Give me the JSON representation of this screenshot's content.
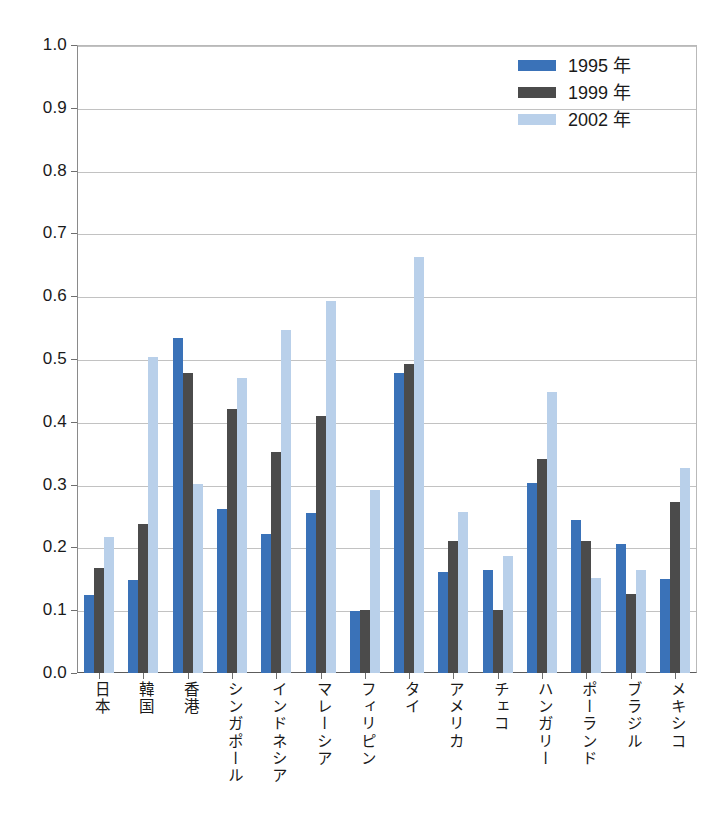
{
  "chart_data": {
    "type": "bar",
    "title": "",
    "subtitle": "",
    "xlabel": "",
    "ylabel": "",
    "ylim": [
      0.0,
      1.0
    ],
    "ytick_step": 0.1,
    "ytick_labels": [
      "0.0",
      "0.1",
      "0.2",
      "0.3",
      "0.4",
      "0.5",
      "0.6",
      "0.7",
      "0.8",
      "0.9",
      "1.0"
    ],
    "grid": "horizontal",
    "legend_position": "top-right",
    "categories": [
      "日本",
      "韓国",
      "香港",
      "シンガポール",
      "インドネシア",
      "マレーシア",
      "フィリピン",
      "タイ",
      "アメリカ",
      "チェコ",
      "ハンガリー",
      "ポーランド",
      "ブラジル",
      "メキシコ"
    ],
    "series": [
      {
        "name": "1995 年",
        "color": "#3a72b8",
        "values": [
          0.125,
          0.148,
          0.534,
          0.261,
          0.222,
          0.255,
          0.098,
          0.477,
          0.161,
          0.164,
          0.303,
          0.243,
          0.205,
          0.15
        ]
      },
      {
        "name": "1999 年",
        "color": "#4b4b4b",
        "values": [
          0.168,
          0.237,
          0.478,
          0.421,
          0.352,
          0.41,
          0.1,
          0.492,
          0.21,
          0.1,
          0.34,
          0.21,
          0.126,
          0.273
        ]
      },
      {
        "name": "2002 年",
        "color": "#b9d0ea",
        "values": [
          0.216,
          0.504,
          0.301,
          0.47,
          0.546,
          0.592,
          0.291,
          0.662,
          0.257,
          0.186,
          0.448,
          0.152,
          0.164,
          0.327
        ]
      }
    ]
  },
  "legend": {
    "items": [
      {
        "label": "1995 年"
      },
      {
        "label": "1999 年"
      },
      {
        "label": "2002 年"
      }
    ]
  }
}
